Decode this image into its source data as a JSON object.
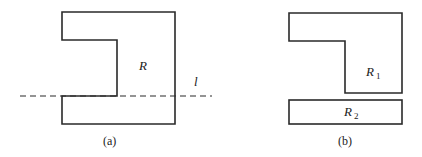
{
  "diagram": {
    "panel_a": {
      "caption": "(a)",
      "region_label": "R",
      "line_label": "l"
    },
    "panel_b": {
      "caption": "(b)",
      "region1_label": "R",
      "region1_sub": "1",
      "region2_label": "R",
      "region2_sub": "2"
    },
    "colors": {
      "stroke": "#2a2a2a",
      "background": "#ffffff"
    }
  }
}
